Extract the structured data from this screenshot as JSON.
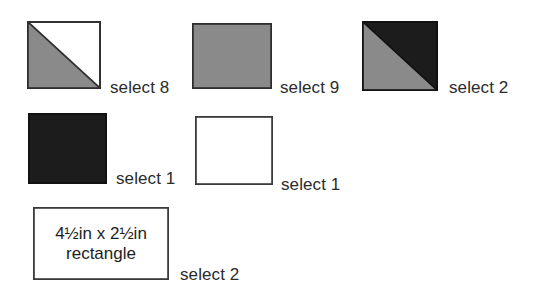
{
  "diagram": {
    "colors": {
      "gray_fill": "#8a8a8a",
      "dark_fill": "#1c1c1c",
      "white_fill": "#ffffff",
      "outline": "#3a3a3a",
      "outline_dark": "#111111",
      "text": "#2b2b2b",
      "background": "#ffffff"
    },
    "pieces": [
      {
        "id": "half-square-triangle-gray-white",
        "shape": "square",
        "pattern": "diagonal-half",
        "fill_lower_left": "#8a8a8a",
        "fill_upper_right": "#ffffff",
        "label": "select 8"
      },
      {
        "id": "solid-gray-square",
        "shape": "square",
        "pattern": "solid",
        "fill": "#8a8a8a",
        "label": "select 9"
      },
      {
        "id": "half-square-triangle-gray-dark",
        "shape": "square",
        "pattern": "diagonal-half",
        "fill_lower_left": "#8a8a8a",
        "fill_upper_right": "#1c1c1c",
        "label": "select 2"
      },
      {
        "id": "solid-dark-square",
        "shape": "square",
        "pattern": "solid",
        "fill": "#1c1c1c",
        "label": "select 1"
      },
      {
        "id": "solid-white-square",
        "shape": "square",
        "pattern": "solid",
        "fill": "#ffffff",
        "label": "select 1"
      },
      {
        "id": "rectangle-piece",
        "shape": "rectangle",
        "pattern": "solid",
        "fill": "#ffffff",
        "caption_line1": "4½in x 2½in",
        "caption_line2": "rectangle",
        "label": "select 2"
      }
    ]
  }
}
